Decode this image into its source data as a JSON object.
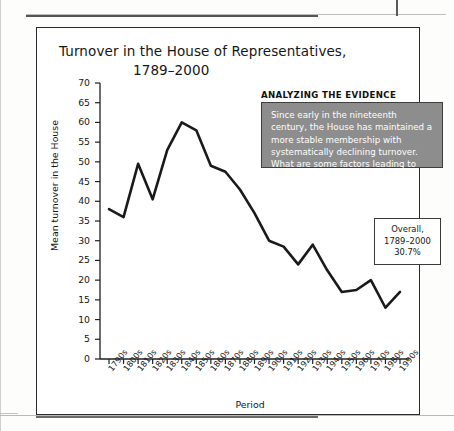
{
  "figure": {
    "title_line1": "Turnover in the House of Representatives,",
    "title_line2": "1789–2000"
  },
  "evidence": {
    "heading": "ANALYZING THE EVIDENCE",
    "body": "Since early in the nineteenth century, the House has maintained a more stable membership with systematically declining turnover. What are some factors leading to lower turnover?",
    "box_fill": "#8d8d8d",
    "text_color": "#ffffff"
  },
  "overall": {
    "line1": "Overall,",
    "line2": "1789–2000",
    "line3": "30.7%"
  },
  "chart_data": {
    "type": "line",
    "title": "Turnover in the House of Representatives, 1789–2000",
    "xlabel": "Period",
    "ylabel": "Mean turnover in the House",
    "ylim": [
      0,
      70
    ],
    "ytick_step": 5,
    "yticks": [
      0,
      5,
      10,
      15,
      20,
      25,
      30,
      35,
      40,
      45,
      50,
      55,
      60,
      65,
      70
    ],
    "grid": false,
    "legend": false,
    "line_color": "#1a1a1a",
    "categories": [
      "1790s",
      "1800s",
      "1810s",
      "1820s",
      "1830s",
      "1840s",
      "1850s",
      "1860s",
      "1870s",
      "1880s",
      "1890s",
      "1900s",
      "1910s",
      "1920s",
      "1930s",
      "1940s",
      "1950s",
      "1960s",
      "1970s",
      "1980s",
      "1990s"
    ],
    "values": [
      38,
      36,
      49.5,
      40.5,
      53,
      60,
      58,
      49,
      47.5,
      43,
      37,
      30,
      28.5,
      24,
      29,
      22.5,
      17,
      17.5,
      20,
      13,
      17
    ],
    "annotations": [
      "Overall, 1789–2000 30.7%"
    ]
  }
}
